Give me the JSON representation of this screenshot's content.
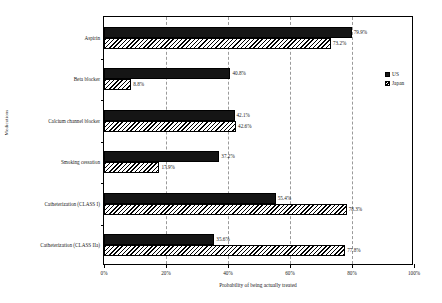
{
  "chart_data": {
    "type": "bar",
    "orientation": "horizontal",
    "title": "",
    "xlabel": "Probability of being actually treated",
    "ylabel": "Medications",
    "xlim": [
      0,
      100
    ],
    "xticks": [
      "0%",
      "20%",
      "40%",
      "60%",
      "80%",
      "100%"
    ],
    "xtick_values": [
      0,
      20,
      40,
      60,
      80,
      100
    ],
    "grid": "vertical dashed gridlines at each x tick",
    "legend_position": "right, outside plot area, upper area",
    "categories": [
      "Aspirin",
      "Beta blocker",
      "Calcium channel blocker",
      "Smoking cessation",
      "Catheterization (CLASS I)",
      "Catheterization (CLASS IIa)"
    ],
    "series": [
      {
        "name": "US",
        "fill": "solid black",
        "color": "#151515",
        "values": [
          79.9,
          40.8,
          42.1,
          37.2,
          55.4,
          35.6
        ],
        "labels": [
          "79.9%",
          "40.8%",
          "42.1%",
          "37.2%",
          "55.4%",
          "35.6%"
        ]
      },
      {
        "name": "Japan",
        "fill": "diagonal hatch",
        "color": "#ffffff",
        "values": [
          73.2,
          8.8,
          42.6,
          17.9,
          78.3,
          77.8
        ],
        "labels": [
          "73.2%",
          "8.8%",
          "42.6%",
          "17.9%",
          "78.3%",
          "77.8%"
        ]
      }
    ]
  },
  "legend": {
    "items": [
      {
        "label": "US"
      },
      {
        "label": "Japan"
      }
    ]
  },
  "colors": {
    "us_bar": "#151515",
    "japan_bar": "#ffffff",
    "axis": "#000000",
    "gridline": "#9a9a9a",
    "text": "#1a1a1a"
  }
}
